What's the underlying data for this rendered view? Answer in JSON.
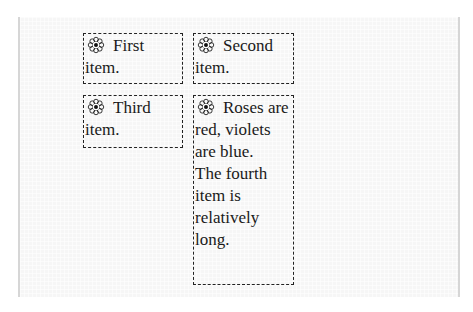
{
  "items": [
    {
      "first_word": "First",
      "rest": "item."
    },
    {
      "first_word": "Second",
      "rest": "item."
    },
    {
      "first_word": "Third",
      "rest": "item."
    },
    {
      "first_word": "Roses",
      "rest": "are red, violets are blue.",
      "extra": "The fourth item is relatively long."
    }
  ],
  "icon": "flower-icon",
  "colors": {
    "border": "#222222",
    "text": "#1a1a1a",
    "background": "#f6f6f6"
  }
}
